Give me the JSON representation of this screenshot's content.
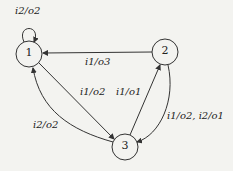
{
  "diagram": {
    "type": "state-machine",
    "nodes": [
      {
        "id": "1",
        "label": "1"
      },
      {
        "id": "2",
        "label": "2"
      },
      {
        "id": "3",
        "label": "3"
      }
    ],
    "edges": [
      {
        "from": "1",
        "to": "1",
        "label": "i2/o2"
      },
      {
        "from": "2",
        "to": "1",
        "label": "i1/o3"
      },
      {
        "from": "1",
        "to": "3",
        "label": "i1/o2"
      },
      {
        "from": "3",
        "to": "2",
        "label": "i1/o1"
      },
      {
        "from": "2",
        "to": "3",
        "label": "i1/o2, i2/o1"
      },
      {
        "from": "3",
        "to": "1",
        "label": "i2/o2"
      }
    ]
  }
}
